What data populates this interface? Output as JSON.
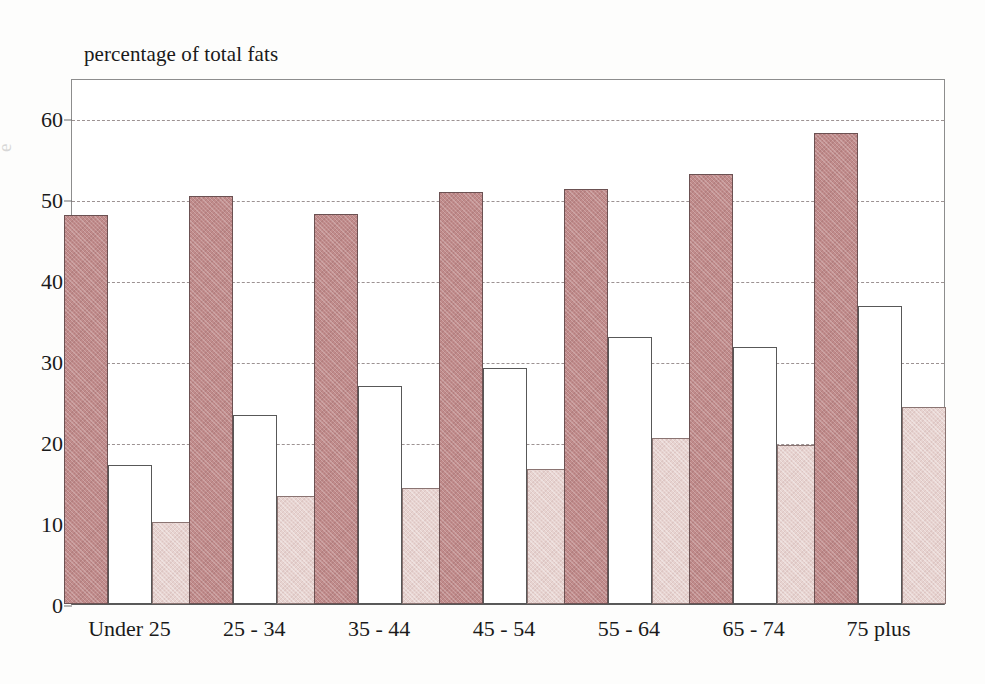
{
  "chart_data": {
    "type": "bar",
    "title": "percentage of total fats",
    "xlabel": "",
    "ylabel": "percentage of total fats",
    "ylim": [
      0,
      65
    ],
    "yticks": [
      0,
      10,
      20,
      30,
      40,
      50,
      60
    ],
    "ytick_labels": [
      "0",
      "10",
      "20",
      "30",
      "40",
      "50",
      "60"
    ],
    "grid": true,
    "legend": "none",
    "categories": [
      "Under 25",
      "25 - 34",
      "35 - 44",
      "45 - 54",
      "55 - 64",
      "65 - 74",
      "75 plus"
    ],
    "series": [
      {
        "name": "series-1",
        "style": "dark-rose-hatched",
        "color": "#c08b8b",
        "values": [
          48.1,
          50.4,
          48.2,
          50.9,
          51.3,
          53.2,
          58.2
        ]
      },
      {
        "name": "series-2",
        "style": "white-outlined",
        "color": "#ffffff",
        "values": [
          17.2,
          23.4,
          27.0,
          29.2,
          33.0,
          31.8,
          36.8
        ]
      },
      {
        "name": "series-3",
        "style": "light-pink-hatched",
        "color": "#e7d3d0",
        "values": [
          10.1,
          13.3,
          14.3,
          16.7,
          20.5,
          19.7,
          24.4
        ]
      }
    ]
  },
  "axis": {
    "cropped_left_label": "e"
  }
}
